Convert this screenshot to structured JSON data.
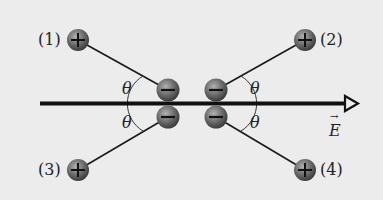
{
  "figure": {
    "labels": {
      "charge1": "(1)",
      "charge2": "(2)",
      "charge3": "(3)",
      "charge4": "(4)"
    },
    "angle_symbol": "θ",
    "field_label": "E",
    "field_arrow": "→",
    "positive_sign": "+",
    "negative_sign": "−",
    "colors": {
      "background": "#ececec",
      "line": "#1a1a1a",
      "charge_fill": "#6b6b6b",
      "charge_highlight": "#a8a8a8"
    }
  }
}
